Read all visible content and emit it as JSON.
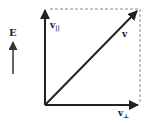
{
  "diagram": {
    "type": "vector-decomposition",
    "colors": {
      "ink": "#222222",
      "dashed": "#888888",
      "background": "#ffffff"
    },
    "field": {
      "label": "E",
      "direction": "up"
    },
    "vectors": [
      {
        "id": "v_parallel",
        "label": "v",
        "subscript": "||",
        "direction": "up"
      },
      {
        "id": "v",
        "label": "v",
        "subscript": "",
        "direction": "diagonal-up-right"
      },
      {
        "id": "v_perp",
        "label": "v",
        "subscript": "⊥",
        "direction": "right"
      }
    ],
    "guides": {
      "style": "dashed",
      "description": "rectangle completing parallelogram"
    }
  }
}
